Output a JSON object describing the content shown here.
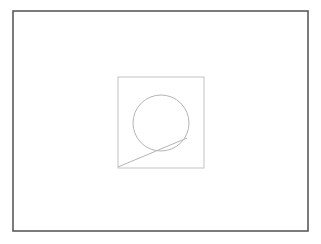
{
  "canvas": {
    "width": 321,
    "height": 244,
    "background_color": "#ffffff",
    "title": "Geometric line drawing"
  },
  "colors": {
    "background": "#ffffff",
    "outer_frame_stroke": "#5a5a5a",
    "inner_square_stroke": "#c8c8c8",
    "circle_stroke": "#b4b4b4",
    "diagonal_line_stroke": "#b4b4b4"
  },
  "shapes": {
    "outer_frame": {
      "name": "outer-frame-rectangle",
      "x": 13,
      "y": 11,
      "width": 295,
      "height": 220,
      "stroke": "#5a5a5a",
      "stroke_width": 1.6,
      "fill": "none"
    },
    "inner_square": {
      "name": "inner-square",
      "x": 118,
      "y": 77,
      "width": 86,
      "height": 91,
      "stroke": "#c8c8c8",
      "stroke_width": 1.1,
      "fill": "none"
    },
    "circle": {
      "name": "circle",
      "cx": 161,
      "cy": 123,
      "r": 28,
      "stroke": "#b4b4b4",
      "stroke_width": 1.0,
      "fill": "none"
    },
    "diagonal_line": {
      "name": "diagonal-tangent-line",
      "x1": 118,
      "y1": 167,
      "x2": 187,
      "y2": 138,
      "stroke": "#b4b4b4",
      "stroke_width": 1.0
    }
  },
  "chart_data": {
    "type": "scatter",
    "xlabel": "",
    "ylabel": "",
    "categories": [
      "outer-frame",
      "inner-square",
      "circle",
      "diagonal-line"
    ],
    "values": [
      4,
      4,
      1,
      1
    ],
    "annotations": [
      "Outer rectangle border 295 x 220 px at (13, 11)",
      "Inner square 86 x 91 px at (118, 77)",
      "Circle center (161, 123) radius 28 px",
      "Diagonal line from (118, 167) to (187, 138) tangent to circle"
    ]
  }
}
